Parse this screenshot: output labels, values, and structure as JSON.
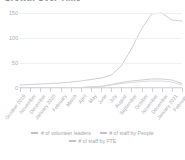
{
  "chart_title": "Growth Over Time",
  "chart_data": {
    "type": "line",
    "title": "Growth Over Time",
    "xlabel": "",
    "ylabel": "",
    "ylim": [
      0,
      160
    ],
    "yticks": [
      0,
      50,
      100,
      150
    ],
    "ytick_labels": [
      "0",
      "50",
      "100",
      "150"
    ],
    "grid": true,
    "legend_position": "bottom",
    "categories": [
      "October 2019",
      "November",
      "December",
      "January 2020",
      "February",
      "March",
      "April",
      "May",
      "June",
      "July",
      "August",
      "September",
      "October",
      "November",
      "December",
      "January 2021",
      "February"
    ],
    "series": [
      {
        "name": "# of volunteer leaders",
        "color": "#c9c9cf",
        "values": [
          6,
          7,
          8,
          9,
          10,
          12,
          14,
          17,
          20,
          26,
          44,
          78,
          118,
          148,
          150,
          136,
          134
        ]
      },
      {
        "name": "# of staff by People",
        "color": "#c9c9cf",
        "values": [
          1,
          1,
          1,
          1,
          1,
          1,
          1,
          2,
          3,
          7,
          11,
          14,
          16,
          18,
          18,
          16,
          9
        ]
      },
      {
        "name": "# of staff by FTE",
        "color": "#d6d6db",
        "values": [
          1,
          1,
          1,
          1,
          1,
          1,
          1,
          2,
          3,
          6,
          9,
          11,
          13,
          14,
          14,
          12,
          6
        ]
      }
    ]
  },
  "legend": {
    "row1": [
      {
        "label": "# of volunteer leaders"
      },
      {
        "label": "# of staff by People"
      }
    ],
    "row2": [
      {
        "label": "# of staff by FTE"
      }
    ]
  },
  "colors": {
    "line": "#c9c9cf",
    "grid": "#f0f0f2",
    "axis": "#d9d9dd",
    "text": "#a8a8af"
  }
}
